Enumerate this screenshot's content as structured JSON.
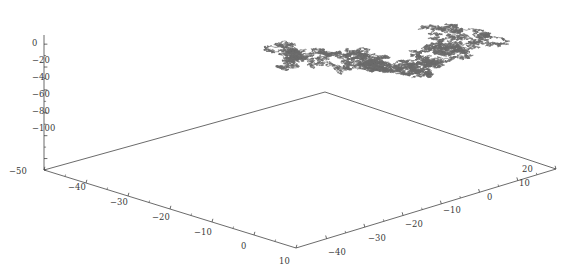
{
  "figure": {
    "kind": "3d-random-walk-plot",
    "background_color": "#ffffff",
    "axis_color": "#3a3a3a",
    "walk_color": "#6b6b6b",
    "width": 562,
    "height": 273
  },
  "chart_data": {
    "type": "line",
    "title": "",
    "subtitle": "",
    "projection": "3d",
    "xlabel": "",
    "ylabel": "",
    "zlabel": "",
    "grid": false,
    "legend": null,
    "series": [
      {
        "name": "random walk",
        "color": "#6b6b6b",
        "description": "single three-dimensional lattice random walk traced as a continuous polyline"
      }
    ],
    "axes": {
      "x": {
        "name": "x-axis-front-left",
        "ticks": [
          -50,
          -40,
          -30,
          -20,
          -10,
          0,
          10
        ],
        "ticklabels": [
          "−50",
          "−40",
          "−30",
          "−20",
          "−10",
          "0",
          "10"
        ],
        "range": [
          -50,
          14
        ],
        "minor_ticks_per_interval": 1
      },
      "y": {
        "name": "y-axis-front-right",
        "ticks": [
          -40,
          -30,
          -20,
          -10,
          0,
          10,
          20
        ],
        "ticklabels": [
          "−40",
          "−30",
          "−20",
          "−10",
          "0",
          "10",
          "20"
        ],
        "range": [
          -48,
          23
        ],
        "minor_ticks_per_interval": 1
      },
      "z": {
        "name": "z-axis-vertical",
        "ticks": [
          0,
          -20,
          -40,
          -60,
          -80,
          -100
        ],
        "ticklabels": [
          "0",
          "−20",
          "−40",
          "−60",
          "−80",
          "−100"
        ],
        "range": [
          -110,
          8
        ],
        "minor_ticks_per_interval": 1
      }
    },
    "ticklabels": {
      "z": [
        {
          "text": "0",
          "x": 32,
          "y": 38
        },
        {
          "text": "−20",
          "x": 32,
          "y": 55
        },
        {
          "text": "−40",
          "x": 32,
          "y": 72
        },
        {
          "text": "−60",
          "x": 32,
          "y": 89
        },
        {
          "text": "−80",
          "x": 32,
          "y": 106
        },
        {
          "text": "−100",
          "x": 32,
          "y": 123
        }
      ],
      "x": [
        {
          "text": "−50",
          "x": 9,
          "y": 166
        },
        {
          "text": "−40",
          "x": 68,
          "y": 182
        },
        {
          "text": "−30",
          "x": 110,
          "y": 197
        },
        {
          "text": "−20",
          "x": 152,
          "y": 212
        },
        {
          "text": "−10",
          "x": 194,
          "y": 227
        },
        {
          "text": "0",
          "x": 241,
          "y": 241
        },
        {
          "text": "10",
          "x": 279,
          "y": 256
        }
      ],
      "y": [
        {
          "text": "−40",
          "x": 328,
          "y": 247
        },
        {
          "text": "−30",
          "x": 368,
          "y": 233
        },
        {
          "text": "−20",
          "x": 405,
          "y": 219
        },
        {
          "text": "−10",
          "x": 443,
          "y": 205
        },
        {
          "text": "0",
          "x": 487,
          "y": 192
        },
        {
          "text": "10",
          "x": 519,
          "y": 178
        },
        {
          "text": "20",
          "x": 522,
          "y": 164
        }
      ]
    },
    "geometry": {
      "origin_corner": [
        44,
        170
      ],
      "back_corner": [
        325,
        92
      ],
      "right_corner": [
        556,
        169
      ],
      "front_corner": [
        296,
        248
      ],
      "z_axis_top": [
        44,
        35
      ],
      "note": "floor is a parallelogram; vertical z-axis rises from the left (origin) corner"
    }
  }
}
